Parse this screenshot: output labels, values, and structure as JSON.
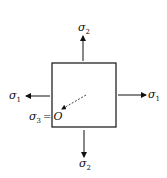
{
  "diagram": {
    "labels": {
      "top": {
        "symbol": "σ",
        "subscript": "2"
      },
      "bottom": {
        "symbol": "σ",
        "subscript": "2"
      },
      "left": {
        "symbol": "σ",
        "subscript": "1"
      },
      "right": {
        "symbol": "σ",
        "subscript": "1"
      },
      "out_of_plane": {
        "symbol": "σ",
        "subscript": "3",
        "equals": "=",
        "value": "O"
      }
    },
    "colors": {
      "stroke": "#111111",
      "background": "#ffffff"
    }
  }
}
